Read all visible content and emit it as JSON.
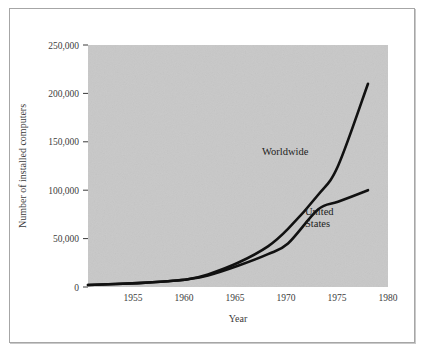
{
  "figure": {
    "background_color": "#ffffff",
    "frame_color": "#a6a6a6",
    "plot_background_color": "#c8c8c8",
    "line_color": "#111111",
    "text_color": "#3c3c3c"
  },
  "axes": {
    "y_title": "Number of installed computers",
    "x_title": "Year",
    "y_ticks": [
      "250,000",
      "200,000",
      "150,000",
      "100,000",
      "50,000",
      "0"
    ],
    "x_ticks": [
      "1955",
      "1960",
      "1965",
      "1970",
      "1975",
      "1980"
    ]
  },
  "labels": {
    "worldwide": "Worldwide",
    "united_states_line1": "United",
    "united_states_line2": "States"
  },
  "chart_data": {
    "type": "line",
    "title": "",
    "xlabel": "Year",
    "ylabel": "Number of installed computers",
    "xlim": [
      1950,
      1980
    ],
    "ylim": [
      0,
      250000
    ],
    "xticks": [
      1955,
      1960,
      1965,
      1970,
      1975,
      1980
    ],
    "yticks": [
      0,
      50000,
      100000,
      150000,
      200000,
      250000
    ],
    "grid": false,
    "legend": "inline-annotations",
    "x": [
      1950,
      1955,
      1958,
      1960,
      1962,
      1965,
      1968,
      1970,
      1973,
      1975,
      1978
    ],
    "series": [
      {
        "name": "Worldwide",
        "values": [
          2000,
          4000,
          6000,
          8000,
          13000,
          25000,
          42000,
          60000,
          95000,
          125000,
          210000
        ]
      },
      {
        "name": "United States",
        "values": [
          2000,
          4000,
          6000,
          8000,
          12000,
          22000,
          34000,
          45000,
          80000,
          88000,
          100000
        ]
      }
    ],
    "annotations": [
      {
        "text": "Worldwide",
        "x": 1967.5,
        "y": 148000
      },
      {
        "text": "United States",
        "x": 1974.2,
        "y": 62000
      }
    ]
  }
}
